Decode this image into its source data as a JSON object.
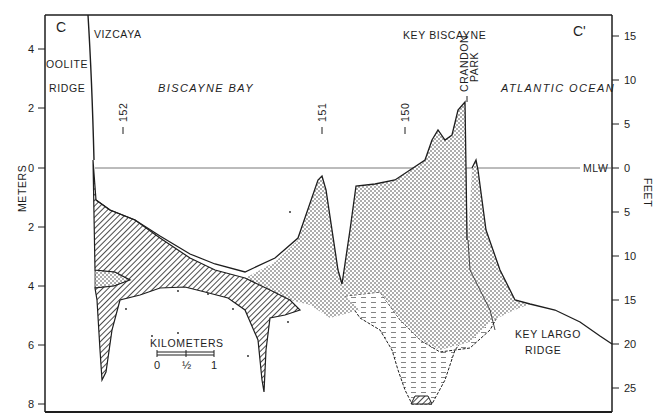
{
  "figure": {
    "section_start_label": "C",
    "section_end_label": "C'",
    "left_axis": {
      "title": "METERS",
      "ticks": [
        {
          "label": "4",
          "y": 49
        },
        {
          "label": "2",
          "y": 108
        },
        {
          "label": "0",
          "y": 168
        },
        {
          "label": "2",
          "y": 227
        },
        {
          "label": "4",
          "y": 286
        },
        {
          "label": "6",
          "y": 345
        },
        {
          "label": "8",
          "y": 404
        }
      ]
    },
    "right_axis": {
      "title": "FEET",
      "ticks": [
        {
          "label": "15",
          "y": 36
        },
        {
          "label": "10",
          "y": 80
        },
        {
          "label": "5",
          "y": 124
        },
        {
          "label": "0",
          "y": 168
        },
        {
          "label": "5",
          "y": 212
        },
        {
          "label": "10",
          "y": 256
        },
        {
          "label": "15",
          "y": 300
        },
        {
          "label": "20",
          "y": 344
        },
        {
          "label": "25",
          "y": 388
        }
      ]
    },
    "datum_label": "MLW",
    "place_labels": {
      "oolite_line1": "OOLITE",
      "oolite_line2": "RIDGE",
      "vizcaya": "VIZCAYA",
      "biscayne_bay": "BISCAYNE BAY",
      "key_biscayne": "KEY BISCAYNE",
      "crandon_line1": "CRANDON",
      "crandon_line2": "PARK",
      "atlantic_ocean": "ATLANTIC OCEAN",
      "key_largo_line1": "KEY LARGO",
      "key_largo_line2": "RIDGE"
    },
    "station_markers": [
      {
        "label": "152",
        "x": 123
      },
      {
        "label": "151",
        "x": 322
      },
      {
        "label": "150",
        "x": 405
      }
    ],
    "scale_bar": {
      "title": "KILOMETERS",
      "ticks": [
        "0",
        "½",
        "1"
      ]
    },
    "colors": {
      "ink": "#1e1e1e",
      "background": "#ffffff",
      "datum_line": "#555555"
    }
  }
}
